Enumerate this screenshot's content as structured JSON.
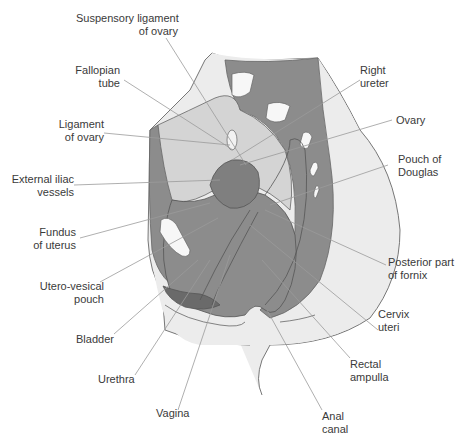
{
  "figure": {
    "colors": {
      "background": "#ffffff",
      "skin": "#ececec",
      "peritoneum_light": "#d4d4d4",
      "organ_dark": "#8c8c8c",
      "bladder": "#6a6a6a",
      "bone": "#f7f7f7",
      "line": "#555555",
      "leader": "#9a9a9a",
      "text": "#3a3a3a"
    },
    "labels": [
      {
        "id": "suspensory-ligament",
        "text": "Suspensory ligament\nof ovary",
        "side": "left"
      },
      {
        "id": "fallopian-tube",
        "text": "Fallopian\ntube",
        "side": "left"
      },
      {
        "id": "ligament-of-ovary",
        "text": "Ligament\nof ovary",
        "side": "left"
      },
      {
        "id": "external-iliac-vessels",
        "text": "External iliac\nvessels",
        "side": "left"
      },
      {
        "id": "fundus-of-uterus",
        "text": "Fundus\nof uterus",
        "side": "left"
      },
      {
        "id": "utero-vesical-pouch",
        "text": "Utero-vesical\npouch",
        "side": "left"
      },
      {
        "id": "bladder",
        "text": "Bladder",
        "side": "left"
      },
      {
        "id": "urethra",
        "text": "Urethra",
        "side": "left"
      },
      {
        "id": "vagina",
        "text": "Vagina",
        "side": "bottom"
      },
      {
        "id": "right-ureter",
        "text": "Right\nureter",
        "side": "right"
      },
      {
        "id": "ovary",
        "text": "Ovary",
        "side": "right"
      },
      {
        "id": "pouch-of-douglas",
        "text": "Pouch of\nDouglas",
        "side": "right"
      },
      {
        "id": "posterior-fornix",
        "text": "Posterior part\nof fornix",
        "side": "right"
      },
      {
        "id": "cervix-uteri",
        "text": "Cervix\nuteri",
        "side": "right"
      },
      {
        "id": "rectal-ampulla",
        "text": "Rectal\nampulla",
        "side": "right"
      },
      {
        "id": "anal-canal",
        "text": "Anal\ncanal",
        "side": "bottom"
      }
    ]
  }
}
